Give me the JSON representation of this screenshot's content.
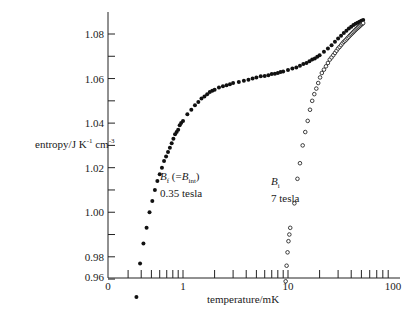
{
  "chart_data": {
    "type": "scatter",
    "title": "",
    "xlabel": "temperature/mK",
    "ylabel": "entropy/J K⁻¹ cm⁻³",
    "xscale": "log",
    "xlim": [
      0.2,
      100
    ],
    "ylim": [
      0.96,
      1.09
    ],
    "x_tick_labels": [
      "0",
      "1",
      "10",
      "100"
    ],
    "y_tick_labels": [
      "0.96",
      "0.98",
      "1.00",
      "1.02",
      "1.04",
      "1.06",
      "1.08"
    ],
    "grid": false,
    "legend": "none (inline annotations)",
    "series": [
      {
        "name": "B_f (=B_int) 0.35 tesla",
        "marker": "filled-circle",
        "annotation": [
          "B_f (=B_int)",
          "0.35 tesla"
        ],
        "x": [
          0.36,
          0.39,
          0.42,
          0.45,
          0.48,
          0.51,
          0.54,
          0.57,
          0.6,
          0.63,
          0.66,
          0.69,
          0.72,
          0.75,
          0.78,
          0.81,
          0.84,
          0.87,
          0.9,
          0.93,
          0.96,
          1.0,
          1.1,
          1.2,
          1.3,
          1.4,
          1.5,
          1.6,
          1.7,
          1.8,
          1.9,
          2.0,
          2.2,
          2.4,
          2.6,
          2.8,
          3.0,
          3.4,
          3.8,
          4.2,
          4.6,
          5.0,
          5.5,
          6.0,
          6.5,
          7.0,
          7.5,
          8.0,
          8.5,
          9.0,
          10,
          11,
          12,
          13,
          14,
          15,
          16,
          17,
          18,
          19,
          20,
          22,
          24,
          26,
          28,
          30,
          32,
          34,
          36,
          38,
          40,
          42,
          44,
          46,
          48,
          50,
          52
        ],
        "y": [
          0.962,
          0.977,
          0.986,
          0.993,
          1.0,
          1.005,
          1.01,
          1.014,
          1.017,
          1.02,
          1.023,
          1.025,
          1.027,
          1.029,
          1.031,
          1.033,
          1.035,
          1.036,
          1.037,
          1.039,
          1.04,
          1.041,
          1.044,
          1.046,
          1.048,
          1.0495,
          1.051,
          1.052,
          1.053,
          1.054,
          1.0545,
          1.055,
          1.056,
          1.0565,
          1.057,
          1.0575,
          1.058,
          1.0585,
          1.059,
          1.0595,
          1.06,
          1.0605,
          1.061,
          1.0612,
          1.0615,
          1.062,
          1.0622,
          1.0625,
          1.063,
          1.0632,
          1.0638,
          1.0645,
          1.065,
          1.0658,
          1.0665,
          1.067,
          1.0678,
          1.0685,
          1.069,
          1.0698,
          1.0705,
          1.072,
          1.0735,
          1.075,
          1.0765,
          1.078,
          1.0792,
          1.0805,
          1.0815,
          1.0825,
          1.0833,
          1.084,
          1.0846,
          1.0851,
          1.0855,
          1.086,
          1.0863
        ]
      },
      {
        "name": "B_i 7 tesla",
        "marker": "open-circle",
        "annotation": [
          "B_i",
          "7 tesla"
        ],
        "x": [
          9.5,
          9.7,
          9.9,
          10.1,
          10.3,
          10.5,
          11.5,
          12.3,
          13.0,
          13.8,
          14.6,
          15.4,
          16.2,
          17.0,
          17.8,
          18.6,
          19.4,
          20.2,
          21.0,
          22,
          23,
          24,
          25,
          26,
          27,
          28,
          29,
          30,
          31,
          32,
          33,
          34,
          35,
          36,
          37,
          38,
          39,
          40,
          41,
          42,
          43,
          44,
          45,
          46,
          47,
          48,
          49,
          50,
          51,
          52
        ],
        "y": [
          0.969,
          0.976,
          0.982,
          0.987,
          0.99,
          0.993,
          1.004,
          1.015,
          1.022,
          1.03,
          1.036,
          1.041,
          1.046,
          1.05,
          1.053,
          1.0555,
          1.058,
          1.0605,
          1.0625,
          1.064,
          1.0655,
          1.067,
          1.0685,
          1.0695,
          1.0705,
          1.0715,
          1.0725,
          1.0735,
          1.0742,
          1.075,
          1.0758,
          1.0765,
          1.077,
          1.0776,
          1.0782,
          1.0788,
          1.0794,
          1.0799,
          1.0804,
          1.0809,
          1.0814,
          1.0819,
          1.0823,
          1.0827,
          1.0831,
          1.0835,
          1.0839,
          1.0843,
          1.0846,
          1.0849
        ]
      }
    ]
  },
  "labels": {
    "ylabel_main": "entropy/J K",
    "ylabel_k_exp": "-1",
    "ylabel_cm": " cm",
    "ylabel_cm_exp": "-3",
    "xlabel": "temperature/mK",
    "annA_line1_B": "B",
    "annA_line1_sub": "f",
    "annA_line1_mid": " (=",
    "annA_line1_B2": "B",
    "annA_line1_sub2": "int",
    "annA_line1_end": ")",
    "annA_line2": "0.35 tesla",
    "annB_line1_B": "B",
    "annB_line1_sub": "i",
    "annB_line2": "7 tesla"
  }
}
